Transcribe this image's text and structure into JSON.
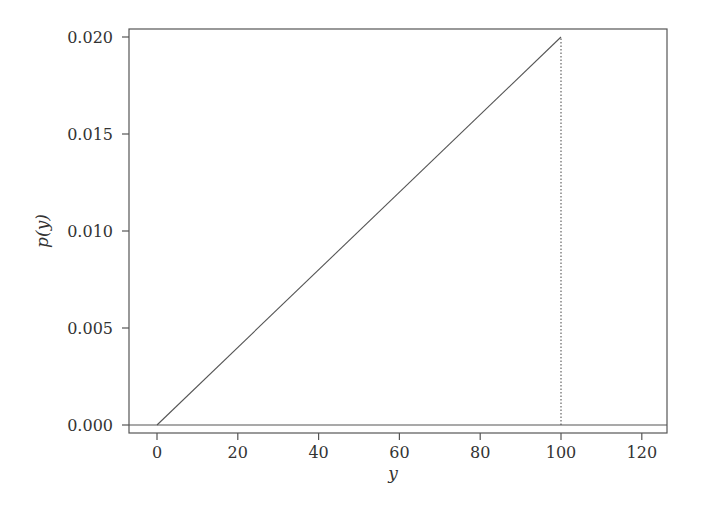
{
  "chart_data": {
    "type": "line",
    "title": "",
    "xlabel": "y",
    "ylabel": "p(y)",
    "xlim": [
      -7,
      127
    ],
    "ylim": [
      -0.0002,
      0.0204
    ],
    "grid": false,
    "legend": null,
    "x_ticks": [
      0,
      20,
      40,
      60,
      80,
      100,
      120
    ],
    "x_tick_labels": [
      "0",
      "20",
      "40",
      "60",
      "80",
      "100",
      "120"
    ],
    "y_ticks": [
      0.0,
      0.005,
      0.01,
      0.015,
      0.02
    ],
    "y_tick_labels": [
      "0.000",
      "0.005",
      "0.010",
      "0.015",
      "0.020"
    ],
    "series": [
      {
        "name": "density",
        "style": "solid",
        "x": [
          0,
          100
        ],
        "values": [
          0.0,
          0.02
        ]
      },
      {
        "name": "support-end",
        "style": "dotted",
        "x": [
          100,
          100
        ],
        "values": [
          0.0,
          0.02
        ]
      },
      {
        "name": "zero-line",
        "style": "solid",
        "x": [
          -7,
          127
        ],
        "values": [
          0.0,
          0.0
        ]
      }
    ]
  },
  "colors": {
    "line": "#555555",
    "axis": "#444444",
    "text": "#333333"
  }
}
